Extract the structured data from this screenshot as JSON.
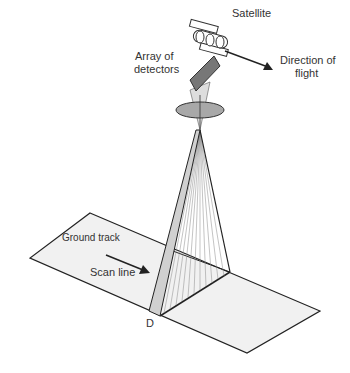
{
  "diagram": {
    "labels": {
      "satellite": "Satellite",
      "array_line1": "Array of",
      "array_line2": "detectors",
      "direction_line1": "Direction of",
      "direction_line2": "flight",
      "ground_track": "Ground track",
      "scan_line": "Scan line",
      "point_d": "D"
    },
    "colors": {
      "line": "#222222",
      "ground": "#f1f1f1",
      "detector": "#777777",
      "lens": "#a8a8a8",
      "strip": "#d0d0d0"
    }
  }
}
